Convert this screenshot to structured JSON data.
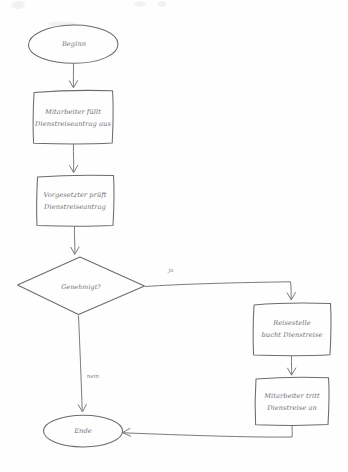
{
  "diagram": {
    "style": "hand-drawn flowchart",
    "stroke_color": "#6b6b70",
    "background_color": "#fefefe",
    "language": "de",
    "nodes": [
      {
        "id": "start",
        "type": "terminator",
        "shape": "ellipse",
        "label": "Beginn",
        "lines": [
          "Beginn"
        ],
        "cx": 73,
        "cy": 44,
        "rx": 45,
        "ry": 19
      },
      {
        "id": "fill_request",
        "type": "process",
        "shape": "rectangle",
        "label": "Mitarbeiter füllt Dienstreiseantrag aus",
        "lines": [
          "Mitarbeiter füllt",
          "Dienstreiseantrag aus"
        ],
        "x": 33,
        "y": 90,
        "w": 80,
        "h": 54
      },
      {
        "id": "check_request",
        "type": "process",
        "shape": "rectangle",
        "label": "Vorgesetzter prüft Dienstreiseantrag",
        "lines": [
          "Vorgesetzter prüft",
          "Dienstreiseantrag"
        ],
        "x": 36,
        "y": 175,
        "w": 78,
        "h": 51
      },
      {
        "id": "approved",
        "type": "decision",
        "shape": "diamond",
        "label": "Genehmigt?",
        "lines": [
          "Genehmigt?"
        ],
        "cx": 81,
        "cy": 286,
        "rx": 64,
        "ry": 29
      },
      {
        "id": "book_trip",
        "type": "process",
        "shape": "rectangle",
        "label": "Reisestelle bucht Dienstreise",
        "lines": [
          "Reisestelle",
          "bucht Dienstreise"
        ],
        "x": 253,
        "y": 303,
        "w": 78,
        "h": 52
      },
      {
        "id": "start_trip",
        "type": "process",
        "shape": "rectangle",
        "label": "Mitarbeiter tritt Dienstreise an",
        "lines": [
          "Mitarbeiter tritt",
          "Dienstreise an"
        ],
        "x": 255,
        "y": 377,
        "w": 74,
        "h": 48
      },
      {
        "id": "end",
        "type": "terminator",
        "shape": "ellipse",
        "label": "Ende",
        "lines": [
          "Ende"
        ],
        "cx": 83,
        "cy": 431,
        "rx": 40,
        "ry": 16
      }
    ],
    "edges": [
      {
        "id": "e1",
        "from": "start",
        "to": "fill_request",
        "label": ""
      },
      {
        "id": "e2",
        "from": "fill_request",
        "to": "check_request",
        "label": ""
      },
      {
        "id": "e3",
        "from": "check_request",
        "to": "approved",
        "label": ""
      },
      {
        "id": "e4",
        "from": "approved",
        "to": "book_trip",
        "label": "ja"
      },
      {
        "id": "e5",
        "from": "approved",
        "to": "end",
        "label": "nein"
      },
      {
        "id": "e6",
        "from": "book_trip",
        "to": "start_trip",
        "label": ""
      },
      {
        "id": "e7",
        "from": "start_trip",
        "to": "end",
        "label": ""
      }
    ],
    "edge_labels": {
      "yes": "ja",
      "no": "nein"
    }
  }
}
